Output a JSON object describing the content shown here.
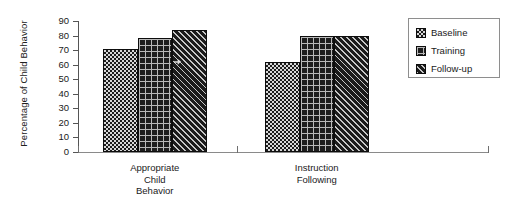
{
  "chart_data": {
    "type": "bar",
    "title": "",
    "xlabel": "",
    "ylabel": "Percentage of Child Behavior",
    "ylim": [
      0,
      90
    ],
    "yticks": [
      0,
      10,
      20,
      30,
      40,
      50,
      60,
      70,
      80,
      90
    ],
    "ytick_labels": [
      "0",
      "10",
      "20",
      "30",
      "40",
      "50",
      "60",
      "70",
      "80",
      "90"
    ],
    "grid": false,
    "legend_position": "top-right",
    "categories": [
      "Appropriate Child Behavior",
      "Instruction Following"
    ],
    "category_label_lines": [
      [
        "Appropriate",
        "Child",
        "Behavior"
      ],
      [
        "Instruction",
        "Following"
      ]
    ],
    "series": [
      {
        "name": "Baseline",
        "pattern": "checkerboard",
        "values": [
          71,
          62
        ]
      },
      {
        "name": "Training",
        "pattern": "crosshatch-grid",
        "values": [
          78,
          80
        ]
      },
      {
        "name": "Follow-up",
        "pattern": "diagonal-hatch",
        "values": [
          84,
          80
        ]
      }
    ]
  },
  "legend": {
    "items": [
      {
        "label": "Baseline"
      },
      {
        "label": "Training"
      },
      {
        "label": "Follow-up"
      }
    ]
  },
  "axes": {
    "y_title": "Percentage of Child Behavior"
  },
  "colors": {
    "ink": "#1a1a1a",
    "axis": "#555555",
    "bar_outline": "#0d0d0d",
    "baseline_fill": "#d8d8d8",
    "training_fill": "#1e1e1e",
    "followup_fill": "#1b1b1b",
    "background": "#ffffff"
  }
}
